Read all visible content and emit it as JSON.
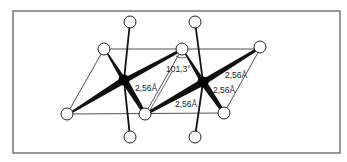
{
  "figure": {
    "colors": {
      "frame": "#555555",
      "line": "#111111",
      "metal_atom": "#000000",
      "ligand_fill": "#ffffff",
      "ligand_stroke": "#222222",
      "background": "#ffffff"
    },
    "labels": {
      "angle": "101,3°",
      "bond_left": "2,56Å",
      "bond_center": "2,56Å",
      "bond_right_upper": "2,56Å",
      "bond_right_lower": "2,56Å"
    },
    "atoms": {
      "metal": [
        {
          "id": "M1",
          "x": 124,
          "y": 80
        },
        {
          "id": "M2",
          "x": 203,
          "y": 82
        }
      ],
      "ligand": [
        {
          "id": "L-top-left",
          "x": 104,
          "y": 49
        },
        {
          "id": "L-top-mid",
          "x": 182,
          "y": 49
        },
        {
          "id": "L-top-right",
          "x": 260,
          "y": 47
        },
        {
          "id": "L-bottom-left",
          "x": 67,
          "y": 114
        },
        {
          "id": "L-bottom-mid",
          "x": 145,
          "y": 114
        },
        {
          "id": "L-bottom-right",
          "x": 224,
          "y": 113
        },
        {
          "id": "L-apex-top-1",
          "x": 130,
          "y": 22
        },
        {
          "id": "L-apex-top-2",
          "x": 195,
          "y": 22
        },
        {
          "id": "L-apex-bottom-1",
          "x": 130,
          "y": 137
        },
        {
          "id": "L-apex-bottom-2",
          "x": 195,
          "y": 137
        }
      ]
    }
  }
}
